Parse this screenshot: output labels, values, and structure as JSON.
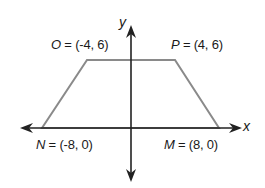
{
  "diagram": {
    "type": "coordinate-plane-trapezoid",
    "axes": {
      "x_label": "x",
      "y_label": "y"
    },
    "vertices": [
      {
        "name": "O",
        "x": -4,
        "y": 6,
        "coords": "(-4, 6)",
        "text_eq": " = "
      },
      {
        "name": "P",
        "x": 4,
        "y": 6,
        "coords": "(4, 6)",
        "text_eq": " = "
      },
      {
        "name": "M",
        "x": 8,
        "y": 0,
        "coords": "(8, 0)",
        "text_eq": " = "
      },
      {
        "name": "N",
        "x": -8,
        "y": 0,
        "coords": "(-8, 0)",
        "text_eq": " = "
      }
    ],
    "colors": {
      "axis": "#222222",
      "trapezoid": "#8a8a8a",
      "text": "#1a1a1a"
    }
  }
}
